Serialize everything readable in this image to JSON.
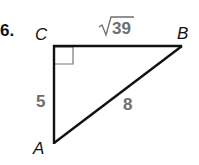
{
  "problem": {
    "number": "6."
  },
  "triangle": {
    "vertices": {
      "A": "A",
      "B": "B",
      "C": "C"
    },
    "sides": {
      "CB": {
        "radical": "√",
        "value": "39"
      },
      "CA": "5",
      "AB": "8"
    },
    "right_angle_at": "C"
  },
  "colors": {
    "line": "#111111",
    "label_gray": "#6e6e6e",
    "text": "#111111"
  }
}
